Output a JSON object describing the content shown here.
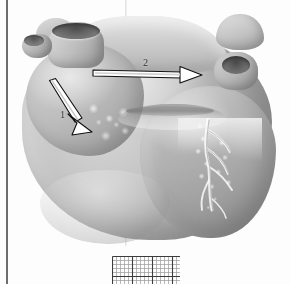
{
  "figure": {
    "view": "posterior base view of the heart",
    "background_color": "#fdfdfd",
    "rendering": "grayscale shaded anatomical drawing"
  },
  "page": {
    "border_rule_color": "#6d6d6d",
    "border_rule_side": "left"
  },
  "annotations": {
    "arrows": [
      {
        "number": "1",
        "label": "1",
        "direction": "down-right",
        "angle_degrees": 62,
        "style": "white-filled-outlined-arrow",
        "fill": "#ffffff",
        "stroke": "#111111",
        "points_to": "atrial appendage nodular surface",
        "label_position": "left-of-shaft"
      },
      {
        "number": "2",
        "label": "2",
        "direction": "right",
        "angle_degrees": 0,
        "style": "white-filled-outlined-arrow",
        "fill": "#ffffff",
        "stroke": "#111111",
        "points_to": "pulmonary vein stump region",
        "label_position": "above-shaft"
      }
    ]
  },
  "scale_grid": {
    "name": "measurement graticule",
    "columns": 17,
    "rows": 7,
    "cell_size_px": 4,
    "major_every": 5,
    "minor_color": "#9a9a9a",
    "major_color": "#3c3c3c"
  },
  "anatomy": {
    "structures": [
      {
        "name": "aorta stump",
        "region": "upper-left"
      },
      {
        "name": "vena cava stump",
        "region": "far-left"
      },
      {
        "name": "pulmonary vein stump",
        "region": "upper-right"
      },
      {
        "name": "left auricle",
        "region": "upper-left-knob"
      },
      {
        "name": "right auricle",
        "region": "upper-right-knob"
      },
      {
        "name": "left atrium",
        "region": "upper-left-mass"
      },
      {
        "name": "right ventricle",
        "region": "lower-right-mass"
      },
      {
        "name": "ventricular mass",
        "region": "center"
      },
      {
        "name": "coronary sulcus",
        "region": "mid-horizontal-groove"
      },
      {
        "name": "coronary artery tree",
        "region": "lower-right"
      },
      {
        "name": "cardiac apex",
        "region": "lower-left"
      }
    ]
  }
}
